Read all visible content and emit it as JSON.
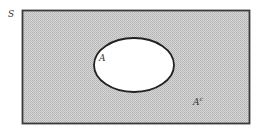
{
  "diagram": {
    "type": "venn",
    "universe_label": "S",
    "set_label": "A",
    "complement_label": "A",
    "complement_superscript": "c",
    "colors": {
      "shading": "#c9c9c9",
      "border": "#3a3a3a",
      "set_fill": "#ffffff"
    }
  }
}
